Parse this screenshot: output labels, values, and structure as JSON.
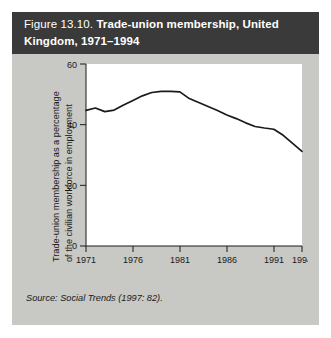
{
  "figure": {
    "number": "Figure 13.10.",
    "title_line1": "Trade-union membership, United",
    "title_line2": "Kingdom, 1971–1994",
    "source": "Source: Social Trends (1997: 82).",
    "background_color": "#c8c8c4",
    "header_color": "#3a3a3a",
    "line_color": "#1a1a1a"
  },
  "chart_data": {
    "type": "line",
    "title": "Trade-union membership, United Kingdom, 1971–1994",
    "xlabel": "",
    "ylabel": "Trade-union membership as a percentage of the civilian workforce in employment",
    "ylabel_line1": "Trade-union membership as a percentage",
    "ylabel_line2": "of the civilian workforce in employment",
    "xlim": [
      1971,
      1994
    ],
    "ylim": [
      0,
      60
    ],
    "xticks": [
      1971,
      1976,
      1981,
      1986,
      1991,
      1994
    ],
    "xtick_labels": [
      "1971",
      "1976",
      "1981",
      "1986",
      "1991",
      "1994"
    ],
    "yticks": [
      0,
      20,
      40,
      60
    ],
    "ytick_labels": [
      "0",
      "20",
      "40",
      "60"
    ],
    "grid": false,
    "legend": "none",
    "x": [
      1971,
      1972,
      1973,
      1974,
      1975,
      1976,
      1977,
      1978,
      1979,
      1980,
      1981,
      1982,
      1983,
      1984,
      1985,
      1986,
      1987,
      1988,
      1989,
      1990,
      1991,
      1992,
      1993,
      1994
    ],
    "values": [
      44.7,
      45.5,
      44.3,
      44.8,
      46.5,
      48.0,
      49.5,
      50.6,
      51.0,
      51.0,
      50.8,
      48.6,
      47.3,
      46.0,
      44.7,
      43.2,
      42.0,
      40.6,
      39.4,
      38.9,
      38.5,
      36.5,
      33.8,
      31.2
    ],
    "series": [
      {
        "name": "Trade-union membership (% of civilian workforce in employment)",
        "values": [
          44.7,
          45.5,
          44.3,
          44.8,
          46.5,
          48.0,
          49.5,
          50.6,
          51.0,
          51.0,
          50.8,
          48.6,
          47.3,
          46.0,
          44.7,
          43.2,
          42.0,
          40.6,
          39.4,
          38.9,
          38.5,
          36.5,
          33.8,
          31.2
        ]
      }
    ]
  }
}
